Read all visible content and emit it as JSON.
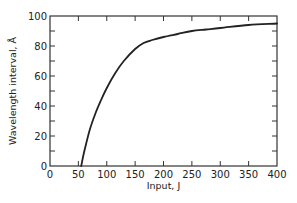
{
  "chart_data": {
    "type": "line",
    "title": "",
    "xlabel": "Input, J",
    "ylabel": "Wavelength interval, Å",
    "xlim": [
      0,
      400
    ],
    "ylim": [
      0,
      100
    ],
    "xticks": [
      0,
      50,
      100,
      150,
      200,
      250,
      300,
      350,
      400
    ],
    "yticks": [
      0,
      20,
      40,
      60,
      80,
      100
    ],
    "minor_yticks": [
      10,
      30,
      50,
      70,
      90
    ],
    "grid": false,
    "legend": null,
    "series": [
      {
        "name": "Wavelength interval",
        "x": [
          55,
          60,
          70,
          80,
          90,
          100,
          115,
          130,
          150,
          165,
          180,
          200,
          225,
          250,
          275,
          300,
          350,
          400
        ],
        "y": [
          0,
          9,
          24,
          35,
          44,
          52,
          62,
          70,
          78,
          82,
          84,
          86,
          88,
          90,
          91,
          92,
          94,
          95
        ]
      }
    ],
    "color": "#222222"
  }
}
